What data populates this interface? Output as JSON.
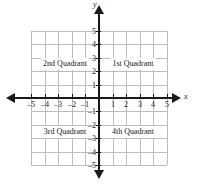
{
  "figure": {
    "type": "coordinate-plane",
    "background_color": "#ffffff",
    "axis_color": "#1a1a1a",
    "grid_color": "#bdbdbd"
  },
  "axes": {
    "x_label": "x",
    "y_label": "y",
    "x_min": -5,
    "x_max": 5,
    "y_min": -5,
    "y_max": 5,
    "x_tick_labels": [
      "–5",
      "–4",
      "–3",
      "–2",
      "–1",
      "1",
      "2",
      "3",
      "4",
      "5"
    ],
    "y_tick_labels": [
      "5",
      "4",
      "3",
      "2",
      "1",
      "–1",
      "–2",
      "–3",
      "–4",
      "–5"
    ]
  },
  "quadrants": {
    "first": "1st Quadrant",
    "second": "2nd Quadrant",
    "third": "3rd Quadrant",
    "fourth": "4th Quadrant"
  },
  "chart_data": {
    "type": "scatter",
    "title": "",
    "xlabel": "x",
    "ylabel": "y",
    "xlim": [
      -5,
      5
    ],
    "ylim": [
      -5,
      5
    ],
    "xticks": [
      -5,
      -4,
      -3,
      -2,
      -1,
      1,
      2,
      3,
      4,
      5
    ],
    "yticks": [
      5,
      4,
      3,
      2,
      1,
      -1,
      -2,
      -3,
      -4,
      -5
    ],
    "grid": true,
    "legend": "none",
    "series": [],
    "annotations": [
      {
        "text": "2nd Quadrant",
        "x": -2.5,
        "y": 2.5
      },
      {
        "text": "1st Quadrant",
        "x": 2.5,
        "y": 2.5
      },
      {
        "text": "3rd Quadrant",
        "x": -2.5,
        "y": -2.5
      },
      {
        "text": "4th Quadrant",
        "x": 2.5,
        "y": -2.5
      }
    ]
  }
}
